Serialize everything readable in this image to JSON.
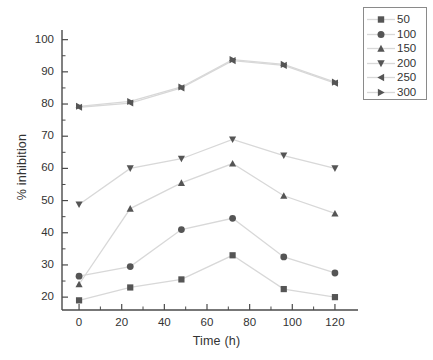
{
  "chart_data": {
    "type": "line",
    "title": "",
    "xlabel": "Time (h)",
    "ylabel": "% inhibition",
    "x": [
      0,
      24,
      48,
      72,
      96,
      120
    ],
    "xlim": [
      -8,
      128
    ],
    "ylim": [
      16,
      103
    ],
    "xticks": [
      0,
      20,
      40,
      60,
      80,
      100,
      120
    ],
    "yticks": [
      20,
      30,
      40,
      50,
      60,
      70,
      80,
      90,
      100
    ],
    "xtick_labels": [
      "0",
      "20",
      "40",
      "60",
      "80",
      "100",
      "120"
    ],
    "ytick_labels": [
      "20",
      "30",
      "40",
      "50",
      "60",
      "70",
      "80",
      "90",
      "100"
    ],
    "grid": false,
    "legend_position": "upper right",
    "line_color": "#d8d8d8",
    "marker_color": "#555555",
    "axis_color": "#4a4a4a",
    "series": [
      {
        "name": "50",
        "marker": "square",
        "values": [
          19.0,
          23.0,
          25.5,
          33.0,
          22.5,
          20.0
        ]
      },
      {
        "name": "100",
        "marker": "circle",
        "values": [
          26.5,
          29.5,
          41.0,
          44.5,
          32.5,
          27.5
        ]
      },
      {
        "name": "150",
        "marker": "triangle-up",
        "values": [
          24.0,
          47.5,
          55.5,
          61.5,
          51.5,
          46.0
        ]
      },
      {
        "name": "200",
        "marker": "triangle-down",
        "values": [
          48.8,
          60.0,
          63.0,
          69.0,
          64.0,
          60.0
        ]
      },
      {
        "name": "250",
        "marker": "triangle-left",
        "values": [
          79.0,
          80.3,
          85.0,
          93.5,
          92.0,
          86.5
        ]
      },
      {
        "name": "300",
        "marker": "triangle-right",
        "values": [
          79.3,
          80.8,
          85.3,
          93.8,
          92.3,
          86.8
        ]
      }
    ]
  },
  "legend": {
    "entries": [
      {
        "label": "50"
      },
      {
        "label": "100"
      },
      {
        "label": "150"
      },
      {
        "label": "200"
      },
      {
        "label": "250"
      },
      {
        "label": "300"
      }
    ]
  }
}
